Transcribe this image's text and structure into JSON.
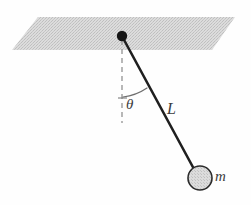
{
  "figure": {
    "background_color": "#fefefe",
    "width": 251,
    "height": 205
  },
  "labels": {
    "angle": "θ",
    "length": "L",
    "mass": "m"
  },
  "elements": {
    "ceiling_plane": {
      "name": "horizontal-support-plane",
      "fill_color": "#d4d4d4",
      "stipple_color": "#bdbdbd",
      "points": "38,17 235,17 212,50 12,50"
    },
    "pivot": {
      "name": "pivot-point",
      "cx": 122,
      "cy": 36,
      "r": 5,
      "color": "#1a1a1a"
    },
    "vertical_reference": {
      "name": "vertical-dashed-reference-line",
      "x": 122,
      "y1": 40,
      "y2": 123,
      "color": "#9a9a9a",
      "dash": "5,4"
    },
    "string": {
      "name": "pendulum-string",
      "x1": 123,
      "y1": 38,
      "x2": 194,
      "y2": 170,
      "color": "#1f1f1f",
      "width": 2.6
    },
    "bob": {
      "name": "pendulum-bob",
      "cx": 200,
      "cy": 178,
      "r": 12,
      "fill_color": "#d8d8d8",
      "stroke_color": "#2b2b2b"
    },
    "angle_arc": {
      "name": "angle-arc",
      "color": "#6e6e6e",
      "path": "M 122 98 Q 134 96 145 89"
    },
    "angle_tick": {
      "name": "angle-baseline-tick",
      "color": "#6e6e6e",
      "path": "M 118 98 L 126 98"
    }
  },
  "colors": {
    "ink": "#1f1f1f",
    "plane_gray": "#d4d4d4",
    "dash_gray": "#9a9a9a",
    "bob_gray": "#d8d8d8",
    "label_gray": "#3c3c3c"
  }
}
